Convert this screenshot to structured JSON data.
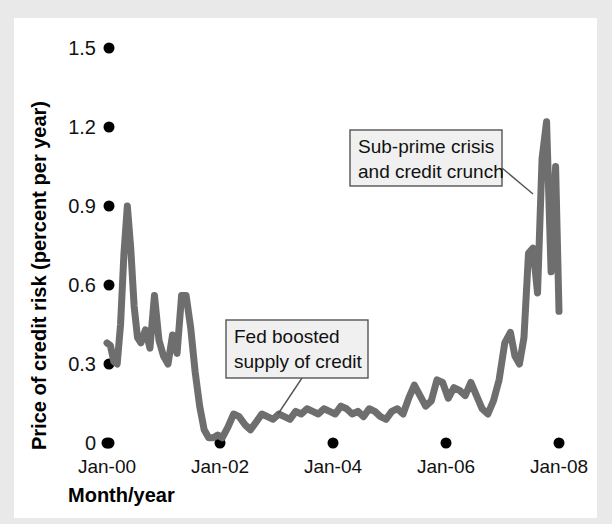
{
  "chart_data": {
    "type": "line",
    "title": "",
    "xlabel": "Month/year",
    "ylabel": "Price of credit risk (percent per year)",
    "ylim": [
      0,
      1.5
    ],
    "xlim": [
      "Jan-00",
      "Jan-08"
    ],
    "grid": false,
    "legend": "none",
    "y_ticks": [
      "1.5",
      "1.2",
      "0.9",
      "0.6",
      "0.3",
      "0"
    ],
    "y_tick_values": [
      1.5,
      1.2,
      0.9,
      0.6,
      0.3,
      0
    ],
    "x_ticks": [
      "Jan-00",
      "Jan-02",
      "Jan-04",
      "Jan-06",
      "Jan-08"
    ],
    "x_tick_values": [
      2000.0,
      2002.0,
      2004.0,
      2006.0,
      2008.0
    ],
    "series": [
      {
        "name": "Price of credit risk",
        "color": "#6e6e6e",
        "x": [
          2000.0,
          2000.06,
          2000.12,
          2000.18,
          2000.24,
          2000.3,
          2000.36,
          2000.42,
          2000.48,
          2000.54,
          2000.6,
          2000.68,
          2000.76,
          2000.84,
          2000.92,
          2001.0,
          2001.08,
          2001.16,
          2001.24,
          2001.32,
          2001.4,
          2001.48,
          2001.56,
          2001.64,
          2001.72,
          2001.8,
          2001.88,
          2001.96,
          2002.04,
          2002.14,
          2002.24,
          2002.34,
          2002.44,
          2002.54,
          2002.64,
          2002.74,
          2002.84,
          2002.94,
          2003.04,
          2003.14,
          2003.24,
          2003.34,
          2003.44,
          2003.54,
          2003.64,
          2003.74,
          2003.84,
          2003.94,
          2004.04,
          2004.14,
          2004.24,
          2004.34,
          2004.44,
          2004.54,
          2004.64,
          2004.74,
          2004.84,
          2004.94,
          2005.04,
          2005.14,
          2005.24,
          2005.34,
          2005.44,
          2005.54,
          2005.64,
          2005.74,
          2005.84,
          2005.94,
          2006.04,
          2006.14,
          2006.24,
          2006.34,
          2006.44,
          2006.54,
          2006.64,
          2006.74,
          2006.84,
          2006.94,
          2007.04,
          2007.14,
          2007.22,
          2007.3,
          2007.38,
          2007.46,
          2007.54,
          2007.62,
          2007.7,
          2007.78,
          2007.86,
          2007.94,
          2008.0
        ],
        "y": [
          0.38,
          0.37,
          0.31,
          0.3,
          0.45,
          0.72,
          0.9,
          0.74,
          0.52,
          0.4,
          0.38,
          0.43,
          0.36,
          0.56,
          0.39,
          0.33,
          0.3,
          0.41,
          0.34,
          0.56,
          0.56,
          0.44,
          0.27,
          0.14,
          0.05,
          0.02,
          0.02,
          0.03,
          0.02,
          0.06,
          0.11,
          0.1,
          0.07,
          0.05,
          0.08,
          0.11,
          0.1,
          0.09,
          0.11,
          0.1,
          0.09,
          0.12,
          0.11,
          0.13,
          0.12,
          0.11,
          0.13,
          0.12,
          0.11,
          0.14,
          0.13,
          0.11,
          0.12,
          0.1,
          0.13,
          0.12,
          0.1,
          0.09,
          0.12,
          0.13,
          0.11,
          0.17,
          0.22,
          0.18,
          0.14,
          0.16,
          0.24,
          0.23,
          0.17,
          0.21,
          0.2,
          0.18,
          0.23,
          0.18,
          0.13,
          0.11,
          0.16,
          0.24,
          0.38,
          0.42,
          0.33,
          0.3,
          0.4,
          0.72,
          0.74,
          0.57,
          1.08,
          1.22,
          0.65,
          1.05,
          0.5
        ]
      }
    ],
    "annotations": [
      {
        "id": "fed-boosted",
        "text_line1": "Fed boosted",
        "text_line2": "supply of credit",
        "box": {
          "x": 226,
          "y": 320,
          "width": 142,
          "height": 58
        },
        "leader": {
          "x1": 302,
          "y1": 378,
          "x2": 278,
          "y2": 414
        }
      },
      {
        "id": "subprime-crisis",
        "text_line1": "Sub-prime crisis",
        "text_line2": "and credit crunch",
        "box": {
          "x": 350,
          "y": 130,
          "width": 152,
          "height": 56
        },
        "leader": {
          "x1": 502,
          "y1": 168,
          "x2": 533,
          "y2": 194
        }
      }
    ]
  },
  "colors": {
    "line": "#6e6e6e",
    "page_background": "#e9e9e9",
    "plot_background": "#ffffff",
    "text": "#111111",
    "callout_fill": "#f0f0f0",
    "callout_stroke": "#555555"
  }
}
